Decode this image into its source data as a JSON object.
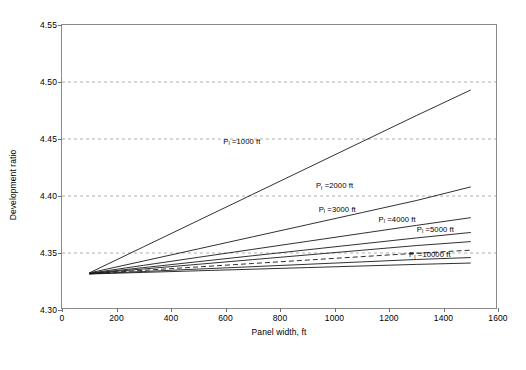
{
  "chart_data": {
    "type": "line",
    "title": "",
    "xlabel": "Panel width, ft",
    "ylabel": "Development ratio",
    "xlim": [
      0,
      1600
    ],
    "ylim": [
      4.3,
      4.55
    ],
    "xticks": [
      0,
      200,
      400,
      600,
      800,
      1000,
      1200,
      1400,
      1600
    ],
    "yticks": [
      4.3,
      4.35,
      4.4,
      4.45,
      4.5,
      4.55
    ],
    "grid": "horizontal-dashed",
    "legend": "inline-annotations",
    "x": [
      100,
      300,
      500,
      700,
      900,
      1100,
      1300,
      1500
    ],
    "series": [
      {
        "name": "P_l =1000 ft",
        "label": "P",
        "sub": "l",
        "suffix": " =1000 ft",
        "style": "solid",
        "values": [
          4.3325,
          4.3555,
          4.3785,
          4.4015,
          4.4245,
          4.4475,
          4.4705,
          4.493
        ]
      },
      {
        "name": "P_l =2000 ft",
        "label": "P",
        "sub": "l",
        "suffix": " =2000 ft",
        "style": "solid",
        "values": [
          4.3325,
          4.343,
          4.3536,
          4.3642,
          4.3748,
          4.3854,
          4.396,
          4.408
        ]
      },
      {
        "name": "P_l =3000 ft",
        "label": "P",
        "sub": "l",
        "suffix": " =3000 ft",
        "style": "solid",
        "values": [
          4.3322,
          4.3392,
          4.3462,
          4.3532,
          4.3602,
          4.3672,
          4.3742,
          4.381
        ]
      },
      {
        "name": "P_l =4000 ft",
        "label": "P",
        "sub": "l",
        "suffix": " =4000 ft",
        "style": "solid",
        "values": [
          4.332,
          4.3372,
          4.3424,
          4.3476,
          4.3528,
          4.358,
          4.3632,
          4.368
        ]
      },
      {
        "name": "P_l =5000 ft",
        "label": "P",
        "sub": "l",
        "suffix": " =5000 ft",
        "style": "solid",
        "values": [
          4.3319,
          4.336,
          4.3401,
          4.3442,
          4.3483,
          4.3524,
          4.3565,
          4.36
        ]
      },
      {
        "name": "unlabeled-dashed",
        "label": "",
        "sub": "",
        "suffix": "",
        "style": "dashed",
        "values": [
          4.3318,
          4.3348,
          4.3378,
          4.3408,
          4.3438,
          4.3468,
          4.3498,
          4.3525
        ]
      },
      {
        "name": "P_l =10000 ft",
        "label": "P",
        "sub": "l",
        "suffix": " =10000 ft",
        "style": "solid",
        "values": [
          4.3317,
          4.3338,
          4.3359,
          4.338,
          4.3401,
          4.3422,
          4.3443,
          4.346
        ]
      },
      {
        "name": "baseline",
        "label": "",
        "sub": "",
        "suffix": "",
        "style": "solid",
        "values": [
          4.3316,
          4.333,
          4.3344,
          4.3358,
          4.3372,
          4.3386,
          4.34,
          4.3412
        ]
      }
    ],
    "annotations": [
      {
        "text": "P",
        "sub": "l",
        "suffix": " =1000 ft",
        "x": 660,
        "y": 4.4475
      },
      {
        "text": "P",
        "sub": "l",
        "suffix": " =2000 ft",
        "x": 1000,
        "y": 4.4085
      },
      {
        "text": "P",
        "sub": "l",
        "suffix": " =3000 ft",
        "x": 1010,
        "y": 4.388
      },
      {
        "text": "P",
        "sub": "l",
        "suffix": " =4000 ft",
        "x": 1230,
        "y": 4.379
      },
      {
        "text": "P",
        "sub": "l",
        "suffix": " =5000 ft",
        "x": 1370,
        "y": 4.3705
      },
      {
        "text": "P",
        "sub": "l",
        "suffix": " =10000 ft",
        "x": 1350,
        "y": 4.348
      }
    ],
    "colors": {
      "line": "#1a1a1a",
      "grid": "#9a9a9a",
      "axis": "#8a8a8a"
    }
  },
  "caption": {
    "text": ""
  }
}
